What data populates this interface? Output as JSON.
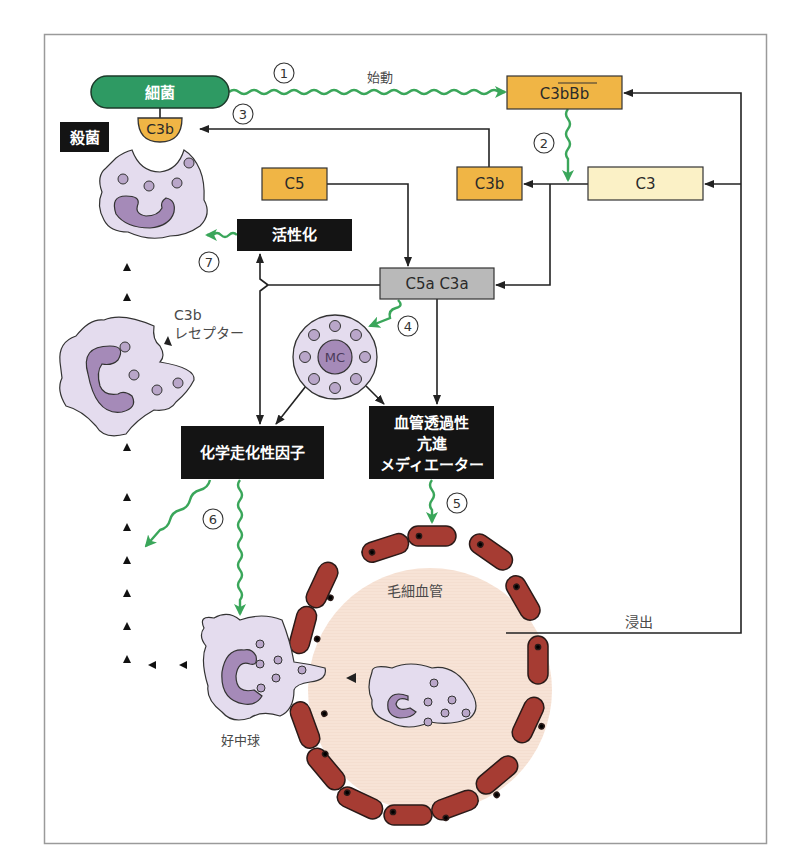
{
  "colors": {
    "frame": "#9a9a9a",
    "bacteria_green": "#2e9a63",
    "complement_orange": "#f0b545",
    "c3_pale": "#fbf1c6",
    "c5a_gray": "#b9b9b9",
    "black_box": "#141414",
    "wavy_green": "#3aa65a",
    "cell_lilac": "#e4dcee",
    "nucleus_purple": "#a58ab8",
    "endothelium_red": "#a63c33",
    "capillary_peach": "#f7e3d6",
    "line": "#222222"
  },
  "nodes": {
    "bacteria": "細菌",
    "c3b_bound": "C3b",
    "kill": "殺菌",
    "c3bbb": "C3bBb",
    "c3": "C3",
    "c3b_right": "C3b",
    "c5": "C5",
    "activation": "活性化",
    "c5a_c3a": "C5a C3a",
    "mast_cell": "MC",
    "chemotactic": "化学走化性因子",
    "vascular_line1": "血管透過性",
    "vascular_line2": "亢進",
    "vascular_line3": "メディエーター",
    "c3b_receptor_line1": "C3b",
    "c3b_receptor_line2": "レセプター",
    "capillary": "毛細血管",
    "neutrophil": "好中球",
    "exudation": "浸出",
    "initiation": "始動"
  },
  "steps": [
    "①",
    "②",
    "③",
    "④",
    "⑤",
    "⑥",
    "⑦"
  ]
}
